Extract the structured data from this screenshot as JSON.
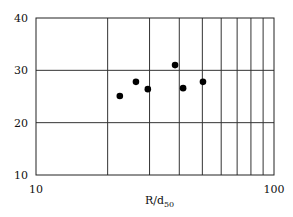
{
  "chart_data": {
    "type": "scatter",
    "title": "",
    "xlabel": "R/d",
    "xlabel_subscript": "50",
    "ylabel": "",
    "xscale": "log",
    "xlim": [
      10,
      100
    ],
    "ylim": [
      10,
      40
    ],
    "x_ticks": [
      10,
      100
    ],
    "y_ticks": [
      10,
      20,
      30,
      40
    ],
    "x_gridlines": [
      20,
      30,
      40,
      50,
      60,
      70,
      80,
      90
    ],
    "y_gridlines": [
      20,
      30
    ],
    "grid": true,
    "legend": null,
    "series": [
      {
        "name": "data",
        "marker": "filled-circle",
        "color": "#000000",
        "x": [
          22.5,
          26.3,
          29.5,
          38.4,
          41.5,
          50.3
        ],
        "y": [
          25.1,
          27.8,
          26.4,
          31.0,
          26.6,
          27.8
        ]
      }
    ]
  }
}
